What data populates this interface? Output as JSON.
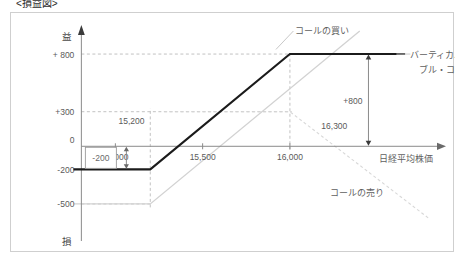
{
  "title": "<損益図>",
  "chart_data": {
    "type": "line",
    "title": "<損益図>",
    "xlabel": "日経平均株価",
    "ylabel_top": "益",
    "ylabel_bottom": "損",
    "xlim": [
      14700,
      16900
    ],
    "ylim": [
      -700,
      1000
    ],
    "grid": true,
    "legend_position": "inline-annotations",
    "x_ticks": [
      {
        "value": 15000,
        "label": "15,000"
      },
      {
        "value": 15500,
        "label": "15,500"
      },
      {
        "value": 16000,
        "label": "16,000"
      }
    ],
    "y_ticks": [
      {
        "value": 800,
        "label": "+ 800"
      },
      {
        "value": 300,
        "label": "+300"
      },
      {
        "value": 0,
        "label": "0"
      },
      {
        "value": -200,
        "label": "-200"
      },
      {
        "value": -500,
        "label": "-500"
      }
    ],
    "series": [
      {
        "name": "バーティカル・ブル・コール",
        "style": "solid-thick",
        "color": "#1b1b1b",
        "points": [
          {
            "x": 14760,
            "y": -200
          },
          {
            "x": 15200,
            "y": -200
          },
          {
            "x": 16000,
            "y": 800
          },
          {
            "x": 16660,
            "y": 800
          }
        ]
      },
      {
        "name": "コールの買い",
        "style": "solid-light",
        "color": "#d2d2d2",
        "points": [
          {
            "x": 14760,
            "y": -500
          },
          {
            "x": 15200,
            "y": -500
          },
          {
            "x": 16400,
            "y": 1000
          }
        ]
      },
      {
        "name": "コールの売り",
        "style": "dashed-light",
        "color": "#d8d8d8",
        "points": [
          {
            "x": 15280,
            "y": 300
          },
          {
            "x": 16000,
            "y": 300
          },
          {
            "x": 16800,
            "y": -630
          }
        ]
      }
    ],
    "annotations": [
      {
        "name": "call-buy",
        "text": "コールの買い",
        "x": 16030,
        "y": 1010
      },
      {
        "name": "vertical-bull-call-line1",
        "text": "バーティカル・",
        "x": 16690,
        "y": 790
      },
      {
        "name": "vertical-bull-call-line2",
        "text": "ブル・コール",
        "x": 16740,
        "y": 660
      },
      {
        "name": "call-sell",
        "text": "コールの売り",
        "x": 16230,
        "y": -400
      },
      {
        "name": "breakeven-lower",
        "text": "15,200",
        "x": 15190,
        "y": 190
      },
      {
        "name": "breakeven-upper",
        "text": "16,300",
        "x": 16180,
        "y": 150
      },
      {
        "name": "max-profit",
        "text": "+800",
        "x": 16450,
        "y": 400
      },
      {
        "name": "max-loss",
        "text": "-200",
        "x": 14860,
        "y": -30
      }
    ]
  }
}
